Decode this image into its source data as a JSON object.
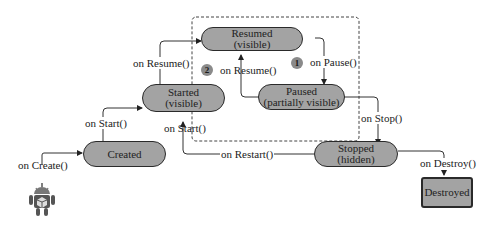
{
  "diagram": {
    "states": {
      "created": {
        "line1": "Created",
        "line2": ""
      },
      "started": {
        "line1": "Started",
        "line2": "(visible)"
      },
      "resumed": {
        "line1": "Resumed",
        "line2": "(visible)"
      },
      "paused": {
        "line1": "Paused",
        "line2": "(partially visible)"
      },
      "stopped": {
        "line1": "Stopped",
        "line2": "(hidden)"
      },
      "destroyed": {
        "line1": "Destroyed",
        "line2": ""
      }
    },
    "transitions": {
      "on_create": "on Create()",
      "on_start_1": "on Start()",
      "on_start_2": "on Start()",
      "on_resume_1": "on Resume()",
      "on_resume_2": "on Resume()",
      "on_pause": "on Pause()",
      "on_stop": "on Stop()",
      "on_restart": "on Restart()",
      "on_destroy": "on Destroy()"
    },
    "badges": {
      "pause": "1",
      "resume": "2"
    },
    "colors": {
      "state_fill": "#a3a3a3",
      "border": "#2a2a2a",
      "badge_fill": "#8a8a8a",
      "android": "#555555"
    }
  }
}
